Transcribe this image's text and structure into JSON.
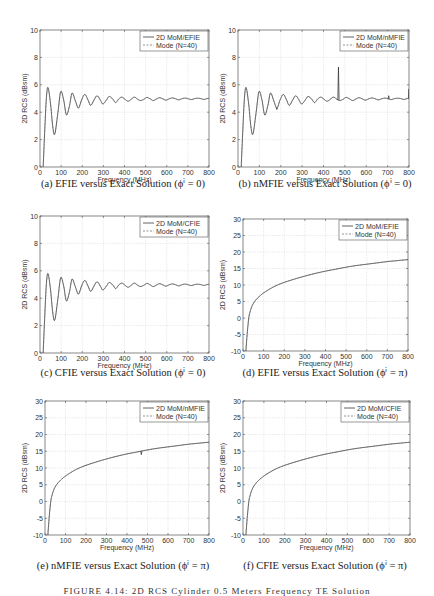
{
  "chart_data": [
    {
      "id": "a",
      "type": "line",
      "caption": "(a) EFIE versus Exact Solution (ϕⁱ = 0)",
      "xlabel": "Frequency (MHz)",
      "ylabel": "2D RCS (dBsm)",
      "xlim": [
        0,
        800
      ],
      "ylim": [
        0,
        10
      ],
      "xticks": [
        0,
        100,
        200,
        300,
        400,
        500,
        600,
        700,
        800
      ],
      "yticks": [
        0,
        2,
        4,
        6,
        8,
        10
      ],
      "grid": true,
      "legend_position": "upper right",
      "legend": [
        "2D MoM/EFIE",
        "Mode (N=40)"
      ],
      "series": [
        {
          "name": "2D MoM/EFIE",
          "style": "solid",
          "x": [
            15,
            22,
            30,
            38,
            50,
            60,
            70,
            85,
            98,
            112,
            125,
            140,
            152,
            168,
            182,
            197,
            212,
            227,
            240,
            256,
            270,
            285,
            298,
            315,
            328,
            345,
            358,
            372,
            387,
            402,
            417,
            432,
            447,
            462,
            476,
            492,
            506,
            522,
            536,
            552,
            566,
            582,
            596,
            612,
            626,
            642,
            656,
            672,
            686,
            702,
            716,
            732,
            746,
            762,
            776,
            792,
            800
          ],
          "y": [
            0,
            2.5,
            5.0,
            5.8,
            4.6,
            3.0,
            2.4,
            4.0,
            5.5,
            4.9,
            3.8,
            4.5,
            5.4,
            4.8,
            4.3,
            4.9,
            5.3,
            4.9,
            4.5,
            4.9,
            5.2,
            4.9,
            4.6,
            4.9,
            5.15,
            4.95,
            4.7,
            4.95,
            5.1,
            4.95,
            4.8,
            4.95,
            5.1,
            4.95,
            4.85,
            4.95,
            5.08,
            4.97,
            4.85,
            4.97,
            5.06,
            4.97,
            4.88,
            4.98,
            5.04,
            4.98,
            4.9,
            4.98,
            5.03,
            4.98,
            4.92,
            4.99,
            5.02,
            4.99,
            4.93,
            5.0,
            5.0
          ]
        },
        {
          "name": "Mode (N=40)",
          "style": "dashed",
          "same_as": "2D MoM/EFIE"
        }
      ]
    },
    {
      "id": "b",
      "type": "line",
      "caption": "(b) nMFIE versus Exact Solution (ϕⁱ = 0)",
      "xlabel": "Frequency (MHz)",
      "ylabel": "2D RCS (dBsm)",
      "xlim": [
        0,
        800
      ],
      "ylim": [
        0,
        10
      ],
      "xticks": [
        0,
        100,
        200,
        300,
        400,
        500,
        600,
        700,
        800
      ],
      "yticks": [
        0,
        2,
        4,
        6,
        8,
        10
      ],
      "grid": true,
      "legend_position": "upper right",
      "legend": [
        "2D MoM/nMFIE",
        "Mode (N=40)"
      ],
      "annotations": [
        "spike at ~470 MHz reaching ~7.3 dBsm",
        "small spike at ~800 MHz reaching ~5.7 dBsm",
        "blip near 705 MHz",
        "small dip at ~182 MHz (~4.2)"
      ],
      "series": [
        {
          "name": "2D MoM/nMFIE",
          "style": "solid",
          "same_shape_as": "a",
          "spikes": [
            {
              "x": 182,
              "y": 4.2
            },
            {
              "x": 470,
              "y": 7.3
            },
            {
              "x": 705,
              "y": 5.2
            },
            {
              "x": 800,
              "y": 5.7
            }
          ]
        },
        {
          "name": "Mode (N=40)",
          "style": "dashed",
          "same_as": "a"
        }
      ]
    },
    {
      "id": "c",
      "type": "line",
      "caption": "(c) CFIE versus Exact Solution (ϕⁱ = 0)",
      "xlabel": "Frequency (MHz)",
      "ylabel": "2D RCS (dBsm)",
      "xlim": [
        0,
        800
      ],
      "ylim": [
        0,
        10
      ],
      "xticks": [
        0,
        100,
        200,
        300,
        400,
        500,
        600,
        700,
        800
      ],
      "yticks": [
        0,
        2,
        4,
        6,
        8,
        10
      ],
      "grid": true,
      "legend_position": "upper right",
      "legend": [
        "2D MoM/CFIE",
        "Mode (N=40)"
      ],
      "series": [
        {
          "name": "2D MoM/CFIE",
          "style": "solid",
          "same_shape_as": "a"
        },
        {
          "name": "Mode (N=40)",
          "style": "dashed",
          "same_as": "a"
        }
      ]
    },
    {
      "id": "d",
      "type": "line",
      "caption": "(d) EFIE versus Exact Solution (ϕⁱ = π)",
      "xlabel": "Frequency (MHz)",
      "ylabel": "2D RCS (dBsm)",
      "xlim": [
        0,
        800
      ],
      "ylim": [
        -10,
        30
      ],
      "xticks": [
        0,
        100,
        200,
        300,
        400,
        500,
        600,
        700,
        800
      ],
      "yticks": [
        -10,
        -5,
        0,
        5,
        10,
        15,
        20,
        25,
        30
      ],
      "grid": true,
      "legend_position": "upper right",
      "legend": [
        "2D MoM/EFIE",
        "Mode (N=40)"
      ],
      "series": [
        {
          "name": "2D MoM/EFIE",
          "style": "solid",
          "x": [
            14,
            20,
            28,
            35,
            45,
            60,
            80,
            100,
            130,
            160,
            200,
            250,
            300,
            350,
            400,
            450,
            500,
            550,
            600,
            650,
            700,
            750,
            800
          ],
          "y": [
            -10,
            -5,
            0,
            2,
            3.8,
            5.3,
            6.6,
            7.6,
            8.8,
            9.8,
            10.8,
            11.8,
            12.7,
            13.5,
            14.2,
            14.8,
            15.4,
            15.9,
            16.3,
            16.7,
            17.1,
            17.4,
            17.7
          ]
        },
        {
          "name": "Mode (N=40)",
          "style": "dashed",
          "same_as": "2D MoM/EFIE"
        }
      ]
    },
    {
      "id": "e",
      "type": "line",
      "caption": "(e) nMFIE versus Exact Solution (ϕⁱ = π)",
      "xlabel": "Frequency (MHz)",
      "ylabel": "2D RCS (dBsm)",
      "xlim": [
        0,
        800
      ],
      "ylim": [
        -10,
        30
      ],
      "xticks": [
        0,
        100,
        200,
        300,
        400,
        500,
        600,
        700,
        800
      ],
      "yticks": [
        -10,
        -5,
        0,
        5,
        10,
        15,
        20,
        25,
        30
      ],
      "grid": true,
      "legend_position": "upper right",
      "legend": [
        "2D MoM/nMFIE",
        "Mode (N=40)"
      ],
      "annotations": [
        "small glitch at ~470 MHz dipping to ~14 dBsm"
      ],
      "series": [
        {
          "name": "2D MoM/nMFIE",
          "style": "solid",
          "same_shape_as": "d",
          "spikes": [
            {
              "x": 470,
              "y": 14.0
            }
          ]
        },
        {
          "name": "Mode (N=40)",
          "style": "dashed",
          "same_as": "d"
        }
      ]
    },
    {
      "id": "f",
      "type": "line",
      "caption": "(f) CFIE versus Exact Solution (ϕⁱ = π)",
      "xlabel": "Frequency (MHz)",
      "ylabel": "2D RCS (dBsm)",
      "xlim": [
        0,
        800
      ],
      "ylim": [
        -10,
        30
      ],
      "xticks": [
        0,
        100,
        200,
        300,
        400,
        500,
        600,
        700,
        800
      ],
      "yticks": [
        -10,
        -5,
        0,
        5,
        10,
        15,
        20,
        25,
        30
      ],
      "grid": true,
      "legend_position": "upper right",
      "legend": [
        "2D MoM/CFIE",
        "Mode (N=40)"
      ],
      "series": [
        {
          "name": "2D MoM/CFIE",
          "style": "solid",
          "same_shape_as": "d"
        },
        {
          "name": "Mode (N=40)",
          "style": "dashed",
          "same_as": "d"
        }
      ]
    }
  ],
  "figure_caption": "FIGURE 4.14: 2D RCS Cylinder 0.5 Meters  Frequency TE Solution",
  "colors": {
    "line": "#3a3a3a",
    "grid": "#d9d9d9",
    "axis": "#555555",
    "text": "#222222"
  }
}
